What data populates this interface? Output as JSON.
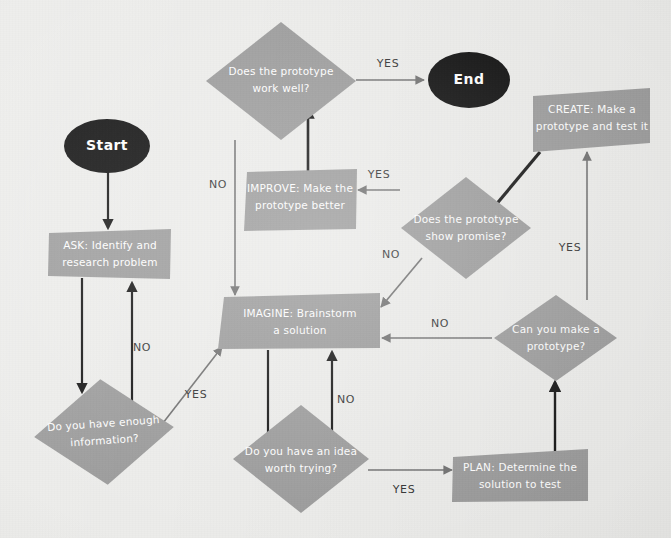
{
  "diagram": {
    "background_color": "#ececea",
    "node_fill": "#9a9a9a",
    "terminal_fill": "#0a0a0a",
    "edge_color_gray": "#6e6e6e",
    "edge_color_black": "#111111",
    "label_color": "#ffffff",
    "edge_label_color": "#2e2e2e"
  },
  "nodes": {
    "start": {
      "label": "Start",
      "shape": "ellipse"
    },
    "end": {
      "label": "End",
      "shape": "ellipse"
    },
    "ask": {
      "label_line1": "ASK: Identify and",
      "label_line2": "research problem",
      "shape": "parallelogram"
    },
    "enough_info": {
      "label_line1": "Do you have enough",
      "label_line2": "information?",
      "shape": "diamond"
    },
    "imagine": {
      "label_line1": "IMAGINE: Brainstorm",
      "label_line2": "a solution",
      "shape": "parallelogram"
    },
    "idea_worth": {
      "label_line1": "Do you have an idea",
      "label_line2": "worth trying?",
      "shape": "diamond"
    },
    "plan": {
      "label_line1": "PLAN: Determine the",
      "label_line2": "solution to test",
      "shape": "parallelogram"
    },
    "can_prototype": {
      "label_line1": "Can you make a",
      "label_line2": "prototype?",
      "shape": "diamond"
    },
    "create": {
      "label_line1": "CREATE: Make a",
      "label_line2": "prototype and test it",
      "shape": "parallelogram"
    },
    "show_promise": {
      "label_line1": "Does the prototype",
      "label_line2": "show promise?",
      "shape": "diamond"
    },
    "improve": {
      "label_line1": "IMPROVE: Make the",
      "label_line2": "prototype better",
      "shape": "parallelogram"
    },
    "work_well": {
      "label_line1": "Does the prototype",
      "label_line2": "work well?",
      "shape": "diamond"
    }
  },
  "edges": {
    "start_to_ask": {
      "label": ""
    },
    "ask_to_enough_info": {
      "label": ""
    },
    "enough_info_no": {
      "label": "NO"
    },
    "enough_info_yes": {
      "label": "YES"
    },
    "imagine_to_idea": {
      "label": ""
    },
    "idea_no": {
      "label": "NO"
    },
    "idea_yes": {
      "label": "YES"
    },
    "plan_to_can_prototype": {
      "label": ""
    },
    "can_prototype_no": {
      "label": "NO"
    },
    "can_prototype_yes": {
      "label": "YES"
    },
    "create_to_show_promise": {
      "label": ""
    },
    "show_promise_no": {
      "label": "NO"
    },
    "show_promise_yes": {
      "label": "YES"
    },
    "improve_to_work_well": {
      "label": ""
    },
    "work_well_no": {
      "label": "NO"
    },
    "work_well_yes": {
      "label": "YES"
    }
  }
}
